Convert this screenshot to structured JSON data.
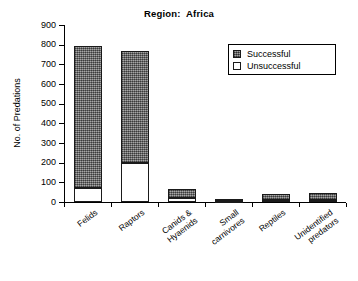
{
  "chart_data": {
    "type": "bar",
    "title": "Region:  Africa",
    "xlabel": "",
    "ylabel": "No. of Predations",
    "ylim": [
      0,
      900
    ],
    "ytick_step": 100,
    "yticks": [
      "900",
      "800",
      "700",
      "600",
      "500",
      "400",
      "300",
      "200",
      "100",
      "0"
    ],
    "grid": false,
    "stacked": true,
    "legend_position": "upper right",
    "categories": [
      "Felids",
      "Raptors",
      "Canids &\nHyaenids",
      "Small\ncarnivores",
      "Reptiles",
      "Unidentified\npredators"
    ],
    "series": [
      {
        "name": "Unsuccessful",
        "color": "#ffffff",
        "values": [
          70,
          200,
          18,
          3,
          5,
          5
        ]
      },
      {
        "name": "Successful",
        "color": "#7a7a7a",
        "values": [
          725,
          570,
          48,
          7,
          33,
          38
        ]
      }
    ],
    "totals": [
      795,
      770,
      66,
      10,
      38,
      43
    ]
  },
  "legend": {
    "items": [
      {
        "label": "Successful",
        "swatch": "hatched-gray"
      },
      {
        "label": "Unsuccessful",
        "swatch": "white"
      }
    ]
  }
}
